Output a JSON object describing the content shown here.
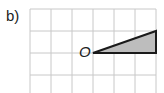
{
  "part_label": "b)",
  "origin_label": "O",
  "grid": {
    "left": 30,
    "top": 9,
    "cell": 21.1,
    "cols": 6,
    "rows": 4,
    "line_color": "#c8c8c8"
  },
  "triangle": {
    "points": [
      [
        93,
        53
      ],
      [
        156,
        31
      ],
      [
        156,
        53
      ]
    ],
    "fill": "#bdbdbd",
    "stroke": "#1a1a1a"
  }
}
